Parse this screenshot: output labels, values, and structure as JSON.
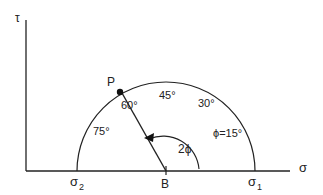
{
  "diagram": {
    "axes": {
      "y_label": "τ",
      "x_label": "σ"
    },
    "points": {
      "sigma2": "σ",
      "sigma2_sub": "2",
      "sigma1": "σ",
      "sigma1_sub": "1",
      "center": "B",
      "p": "P"
    },
    "angle_labels": {
      "a75": "75°",
      "a60": "60°",
      "a45": "45°",
      "a30": "30°",
      "a15": "ϕ=15°"
    },
    "arc_label": "2ϕ",
    "colors": {
      "ink": "#222222",
      "background": "#ffffff"
    }
  }
}
